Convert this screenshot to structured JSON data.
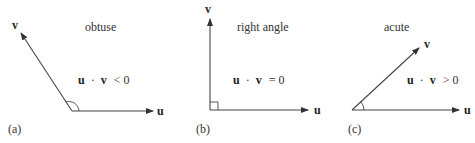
{
  "diagram": {
    "panels": [
      {
        "id": "a",
        "label": "(a)",
        "caption": "obtuse",
        "equation": "u · v < 0",
        "equation_parts": {
          "u": "u",
          "dot": "·",
          "v": "v",
          "rel": "< 0"
        },
        "vector_u_label": "u",
        "vector_v_label": "v",
        "angle_marker": "arc"
      },
      {
        "id": "b",
        "label": "(b)",
        "caption": "right angle",
        "equation": "u · v = 0",
        "equation_parts": {
          "u": "u",
          "dot": "·",
          "v": "v",
          "rel": "= 0"
        },
        "vector_u_label": "u",
        "vector_v_label": "v",
        "angle_marker": "square"
      },
      {
        "id": "c",
        "label": "(c)",
        "caption": "acute",
        "equation": "u · v > 0",
        "equation_parts": {
          "u": "u",
          "dot": "·",
          "v": "v",
          "rel": "> 0"
        },
        "vector_u_label": "u",
        "vector_v_label": "v",
        "angle_marker": "arc"
      }
    ],
    "colors": {
      "line": "#444444",
      "text": "#333333",
      "background": "#ffffff"
    }
  }
}
